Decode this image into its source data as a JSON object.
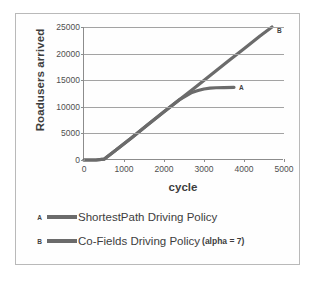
{
  "chart_data": {
    "type": "line",
    "title": "",
    "xlabel": "cycle",
    "ylabel": "Roadusers arrived",
    "xlim": [
      0,
      5000
    ],
    "ylim": [
      0,
      25000
    ],
    "grid": "horizontal",
    "legend_position": "below",
    "xticks": [
      "0",
      "1000",
      "2000",
      "3000",
      "4000",
      "5000"
    ],
    "xtick_values": [
      0,
      1000,
      2000,
      3000,
      4000,
      5000
    ],
    "yticks": [
      "0",
      "5000",
      "10000",
      "15000",
      "20000",
      "25000"
    ],
    "ytick_values": [
      0,
      5000,
      10000,
      15000,
      20000,
      25000
    ],
    "series": [
      {
        "key": "A",
        "name": "ShortestPath Driving Policy",
        "color": "#6b6b6b",
        "end_label": "A",
        "x": [
          0,
          300,
          500,
          800,
          1200,
          1600,
          2000,
          2400,
          2700,
          2850,
          3000,
          3150,
          3300,
          3500,
          3750
        ],
        "values": [
          0,
          0,
          150,
          1900,
          4250,
          6650,
          9050,
          11400,
          12700,
          13050,
          13350,
          13500,
          13580,
          13620,
          13650
        ]
      },
      {
        "key": "B",
        "name": "Co-Fields Driving Policy",
        "name_suffix": "(alpha = 7)",
        "color": "#6b6b6b",
        "end_label": "B",
        "x": [
          0,
          300,
          500,
          800,
          1200,
          1600,
          2000,
          2400,
          2800,
          3200,
          3600,
          4000,
          4400,
          4700
        ],
        "values": [
          0,
          0,
          150,
          1900,
          4250,
          6650,
          9050,
          11400,
          13750,
          16150,
          18550,
          20900,
          23300,
          25000
        ]
      }
    ]
  },
  "legend": [
    {
      "key": "A",
      "label": "ShortestPath Driving Policy",
      "suffix": ""
    },
    {
      "key": "B",
      "label": "Co-Fields Driving Policy",
      "suffix": "(alpha = 7)"
    }
  ]
}
